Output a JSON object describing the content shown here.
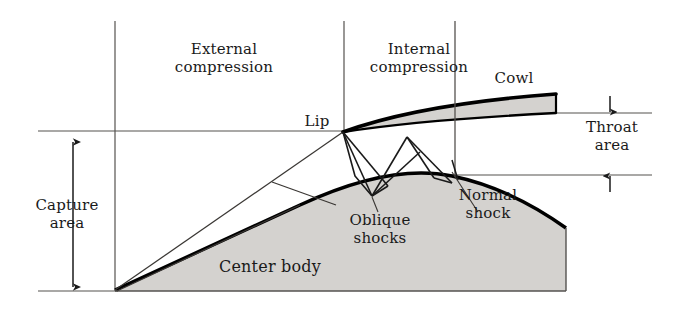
{
  "figure": {
    "kind": "supersonic-inlet-schematic",
    "background_color": "#ffffff",
    "ink_color": "#1a1a1a",
    "body_fill_color": "#d4d2cf",
    "outline_color": "#000000",
    "thin_line_color": "#55524f"
  },
  "labels": {
    "external_compression": "External\ncompression",
    "internal_compression": "Internal\ncompression",
    "cowl": "Cowl",
    "lip": "Lip",
    "throat_area": "Throat\narea",
    "capture_area": "Capture\narea",
    "oblique_shocks": "Oblique\nshocks",
    "normal_shock": "Normal\nshock",
    "center_body": "Center body"
  },
  "annotations": {
    "capture_area_dimension": "double-headed-vertical-arrow",
    "throat_area_dimension": "outward-pointing-vertical-arrows",
    "divider_external_internal": "vertical-divider-line",
    "divider_capture_station": "vertical-divider-line",
    "normal_shock_line": "vertical-line"
  },
  "geometry": {
    "capture_area_arrow_x": 73,
    "capture_area_top_y": 141,
    "capture_area_bottom_y": 288,
    "throat_arrow_x": 610,
    "throat_top_y": 113,
    "throat_bottom_y": 175,
    "lip_point": [
      343,
      132
    ],
    "center_body_tip": [
      115,
      290
    ],
    "cowl_trailing_x": 556,
    "center_body_trailing_x": 566,
    "baseline_y": 291,
    "upper_centerline_y": 131
  }
}
